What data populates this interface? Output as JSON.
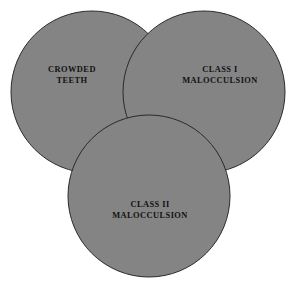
{
  "figure": {
    "kind": "venn-diagram",
    "background_color": "#ffffff",
    "circle_fill_color": "#848484",
    "circle_stroke_color": "#2a2a2a",
    "circle_stroke_width": 1,
    "sets": [
      {
        "id": "crowded-teeth",
        "position": "top-left",
        "line1": "CROWDED",
        "line2": "TEETH",
        "cx": 92,
        "cy": 92,
        "r": 81
      },
      {
        "id": "class-i-malocculsion",
        "position": "top-right",
        "line1": "CLASS I",
        "line2": "MALOCCULSION",
        "cx": 204,
        "cy": 92,
        "r": 81
      },
      {
        "id": "class-ii-malocculsion",
        "position": "bottom-center",
        "line1": "CLASS II",
        "line2": "MALOCCULSION",
        "cx": 149,
        "cy": 196,
        "r": 81
      }
    ]
  }
}
